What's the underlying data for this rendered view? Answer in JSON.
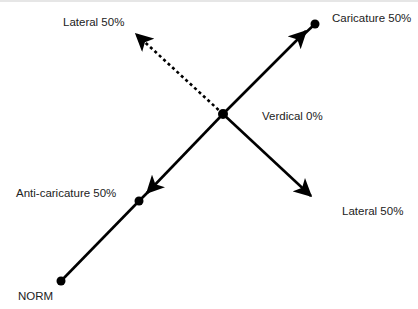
{
  "diagram": {
    "type": "face-space vector diagram",
    "colors": {
      "stroke": "#000000",
      "text": "#222222",
      "background": "#ffffff"
    },
    "points": {
      "norm": {
        "label": "NORM",
        "x": 61,
        "y": 281
      },
      "anti_caricature": {
        "label": "Anti-caricature 50%",
        "x": 139,
        "y": 201
      },
      "verdical": {
        "label": "Verdical 0%",
        "x": 223,
        "y": 114
      },
      "caricature": {
        "label": "Caricature 50%",
        "x": 315,
        "y": 24
      }
    },
    "vectors": [
      {
        "name": "to-caricature",
        "from": "verdical",
        "to": [
          307,
          30
        ],
        "style": "solid"
      },
      {
        "name": "to-anti-caricature",
        "from": "verdical",
        "to": [
          146,
          194
        ],
        "style": "solid"
      },
      {
        "name": "lateral-upper",
        "from": "verdical",
        "to": [
          135,
          33
        ],
        "style": "dotted"
      },
      {
        "name": "lateral-lower",
        "from": "verdical",
        "to": [
          312,
          197
        ],
        "style": "solid"
      }
    ],
    "labels": {
      "lateral_upper": "Lateral 50%",
      "caricature": "Caricature 50%",
      "verdical": "Verdical 0%",
      "anti_caricature": "Anti-caricature 50%",
      "lateral_lower": "Lateral 50%",
      "norm": "NORM"
    }
  }
}
